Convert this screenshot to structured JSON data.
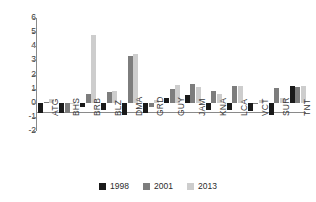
{
  "chart_data": {
    "type": "bar",
    "title": "",
    "subtitle": "",
    "xlabel": "",
    "ylabel": "",
    "grid": false,
    "legend_position": "bottom",
    "ylim": [
      -2,
      6
    ],
    "yticks": [
      6,
      5,
      4,
      3,
      2,
      1,
      0,
      -1,
      -2
    ],
    "ytick_labels": [
      "6",
      "5",
      "4",
      "3",
      "2",
      "1",
      "0",
      "-1",
      "-2"
    ],
    "categories": [
      "ATG",
      "BHS",
      "BRB",
      "BLZ",
      "DMA",
      "GRD",
      "GUY",
      "JAM",
      "KNA",
      "LCA",
      "VCT",
      "SUR",
      "TNT"
    ],
    "series": [
      {
        "name": "1998",
        "color": "#1a1a1a",
        "values": [
          -0.7,
          -0.75,
          -0.3,
          -0.5,
          -0.9,
          -0.7,
          0.35,
          0.55,
          -0.5,
          -0.5,
          -0.6,
          -0.9,
          1.2
        ]
      },
      {
        "name": "2001",
        "color": "#7d7d7d",
        "values": [
          0.05,
          -0.7,
          0.65,
          0.75,
          3.3,
          -0.3,
          1.0,
          1.35,
          0.8,
          1.2,
          0.0,
          1.05,
          1.15
        ]
      },
      {
        "name": "2013",
        "color": "#cdcdcd",
        "values": [
          0.3,
          -0.05,
          4.8,
          0.85,
          3.45,
          0.2,
          1.25,
          1.1,
          0.6,
          1.2,
          0.2,
          0.35,
          1.2
        ]
      }
    ]
  },
  "legend": {
    "items": [
      {
        "label": "1998"
      },
      {
        "label": "2001"
      },
      {
        "label": "2013"
      }
    ]
  }
}
